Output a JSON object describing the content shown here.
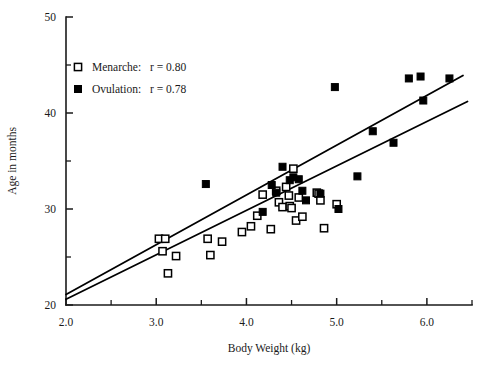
{
  "chart_data": {
    "type": "scatter",
    "title": "",
    "xlabel": "Body Weight (kg)",
    "ylabel": "Age in months",
    "xlim": [
      2.0,
      6.5
    ],
    "ylim": [
      20,
      50
    ],
    "xticks": [
      "2.0",
      "3.0",
      "4.0",
      "5.0",
      "6.0"
    ],
    "xtick_values": [
      2.0,
      3.0,
      4.0,
      5.0,
      6.0
    ],
    "xminor_values": [
      2.5,
      3.5,
      4.5,
      5.5,
      6.5
    ],
    "yticks": [
      "20",
      "30",
      "40",
      "50"
    ],
    "ytick_values": [
      20,
      30,
      40,
      50
    ],
    "yminor_values": [
      25,
      35,
      45
    ],
    "grid": false,
    "legend_position": "upper-left-inside",
    "series": [
      {
        "name": "Menarche",
        "marker": "open-square",
        "correlation": "r = 0.80",
        "legend_label": "Menarche:",
        "points": [
          [
            3.03,
            26.9
          ],
          [
            3.1,
            26.9
          ],
          [
            3.07,
            25.6
          ],
          [
            3.22,
            25.1
          ],
          [
            3.13,
            23.3
          ],
          [
            3.57,
            26.9
          ],
          [
            3.6,
            25.2
          ],
          [
            3.73,
            26.6
          ],
          [
            3.95,
            27.6
          ],
          [
            4.05,
            28.2
          ],
          [
            4.12,
            29.3
          ],
          [
            4.18,
            31.5
          ],
          [
            4.27,
            27.9
          ],
          [
            4.33,
            31.9
          ],
          [
            4.36,
            30.7
          ],
          [
            4.4,
            30.2
          ],
          [
            4.44,
            32.3
          ],
          [
            4.47,
            31.4
          ],
          [
            4.48,
            30.3
          ],
          [
            4.5,
            30.1
          ],
          [
            4.52,
            34.2
          ],
          [
            4.55,
            28.8
          ],
          [
            4.58,
            31.2
          ],
          [
            4.62,
            29.2
          ],
          [
            4.78,
            31.7
          ],
          [
            4.8,
            31.6
          ],
          [
            4.82,
            30.9
          ],
          [
            4.86,
            28.0
          ],
          [
            5.0,
            30.5
          ]
        ]
      },
      {
        "name": "Ovulation",
        "marker": "filled-square",
        "correlation": "r = 0.78",
        "legend_label": "Ovulation:",
        "points": [
          [
            3.55,
            32.6
          ],
          [
            4.18,
            29.7
          ],
          [
            4.28,
            32.5
          ],
          [
            4.33,
            31.7
          ],
          [
            4.4,
            34.4
          ],
          [
            4.48,
            33.0
          ],
          [
            4.52,
            33.3
          ],
          [
            4.58,
            33.1
          ],
          [
            4.62,
            31.9
          ],
          [
            4.66,
            30.9
          ],
          [
            4.82,
            31.6
          ],
          [
            4.98,
            42.7
          ],
          [
            5.02,
            30.0
          ],
          [
            5.23,
            33.4
          ],
          [
            5.4,
            38.1
          ],
          [
            5.63,
            36.9
          ],
          [
            5.8,
            43.6
          ],
          [
            5.93,
            43.8
          ],
          [
            5.96,
            41.3
          ],
          [
            6.25,
            43.6
          ]
        ]
      }
    ],
    "regression_lines": [
      {
        "name": "Ovulation",
        "x0": 2.0,
        "y0": 21.1,
        "x1": 6.4,
        "y1": 43.9
      },
      {
        "name": "Menarche",
        "x0": 2.0,
        "y0": 20.6,
        "x1": 6.45,
        "y1": 41.2
      }
    ]
  },
  "legend": {
    "entries": [
      {
        "label": "Menarche:",
        "value": "r = 0.80",
        "marker": "open-square"
      },
      {
        "label": "Ovulation:",
        "value": "r = 0.78",
        "marker": "filled-square"
      }
    ]
  }
}
